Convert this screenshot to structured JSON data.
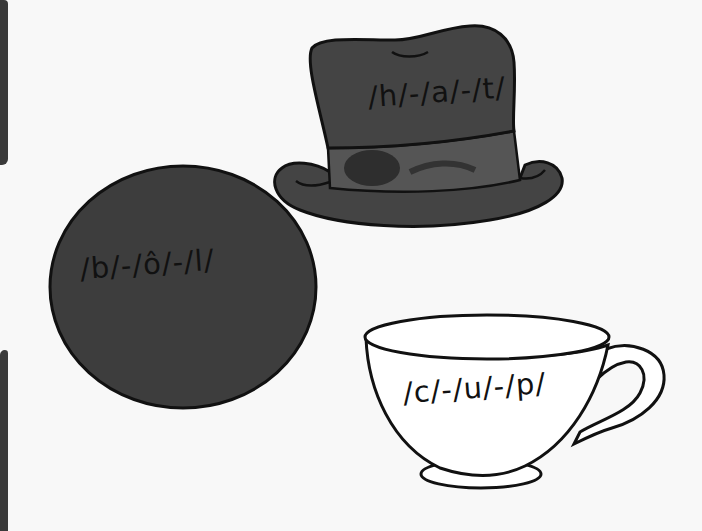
{
  "worksheet": {
    "items": [
      {
        "name": "ball",
        "phonemes": "/b/-/ô/-/l/",
        "fill": "#3d3d3d"
      },
      {
        "name": "hat",
        "phonemes": "/h/-/a/-/t/",
        "fill": "#444444"
      },
      {
        "name": "cup",
        "phonemes": "/c/-/u/-/p/",
        "fill": "#ffffff"
      }
    ]
  },
  "colors": {
    "background": "#f8f8f8",
    "outline": "#111111",
    "dark_fill": "#3d3d3d",
    "band_fill": "#555555"
  }
}
